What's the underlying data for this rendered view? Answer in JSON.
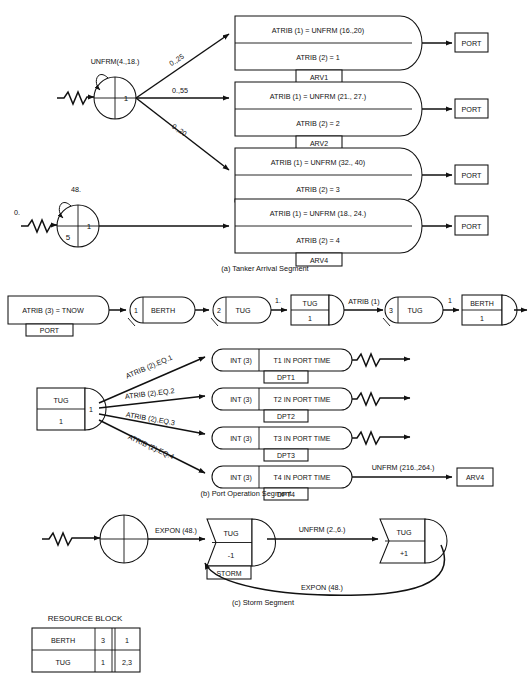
{
  "figure": {
    "captions": {
      "a": "(a)  Tanker Arrival Segment",
      "b": "(b) Port Operation Segment",
      "c": "(c)  Storm Segment"
    }
  },
  "segment_a": {
    "source1": {
      "self_loop_label": "UNFRM(4.,18.)",
      "quad_right": "1",
      "quad_lower_left": ""
    },
    "source2": {
      "self_loop_label": "48.",
      "start_label": "0.",
      "quad_right": "1",
      "quad_lower_left": "5"
    },
    "branch_probabilities": [
      "0.,25",
      "0.,55",
      "0.,20"
    ],
    "arrival_nodes": [
      {
        "line1": "ATRIB (1) = UNFRM (16.,20)",
        "line2": "ATRIB (2) = 1",
        "tag": "ARV1",
        "dest": "PORT"
      },
      {
        "line1": "ATRIB (1) = UNFRM (21., 27.)",
        "line2": "ATRIB (2) = 2",
        "tag": "ARV2",
        "dest": "PORT"
      },
      {
        "line1": "ATRIB (1) = UNFRM (32., 40)",
        "line2": "ATRIB (2) = 3",
        "tag": "ARV3",
        "dest": "PORT"
      },
      {
        "line1": "ATRIB (1) = UNFRM (18., 24.)",
        "line2": "ATRIB (2) = 4",
        "tag": "ARV4",
        "dest": "PORT"
      }
    ]
  },
  "segment_b_chain": {
    "assign_node": {
      "text": "ATRIB (3) = TNOW",
      "tag": "PORT"
    },
    "await1": {
      "num": "1",
      "label": "BERTH"
    },
    "await2": {
      "num": "2",
      "label": "TUG"
    },
    "link_label_1": "1.",
    "free1": {
      "label": "TUG",
      "value": "1"
    },
    "link_label_2": "ATRIB (1)",
    "await3": {
      "num": "3",
      "label": "TUG"
    },
    "link_label_3": "1",
    "free2": {
      "label": "BERTH",
      "value": "1"
    }
  },
  "segment_b": {
    "source_node": {
      "label": "TUG",
      "value": "1",
      "num": "1"
    },
    "branch_conditions": [
      "ATRIB (2).EQ.1",
      "ATRIB (2).EQ.2",
      "ATRIB (2).EQ.3",
      "ATRIB (2).EQ.4"
    ],
    "stat_nodes": [
      {
        "left": "INT (3)",
        "right": "T1  IN PORT TIME",
        "tag": "DPT1",
        "terminator": "sink"
      },
      {
        "left": "INT (3)",
        "right": "T2  IN PORT TIME",
        "tag": "DPT2",
        "terminator": "sink"
      },
      {
        "left": "INT (3)",
        "right": "T3  IN PORT TIME",
        "tag": "DPT3",
        "terminator": "sink"
      },
      {
        "left": "INT (3)",
        "right": "T4  IN PORT TIME",
        "tag": "DPT4",
        "terminator": "box",
        "out_label": "UNFRM (216.,264.)",
        "out_target": "ARV4"
      }
    ]
  },
  "segment_c": {
    "storm_node": {
      "label": "TUG",
      "value": "-1",
      "tag": "STORM"
    },
    "restore_node": {
      "label": "TUG",
      "value": "+1"
    },
    "edge_in": "EXPON (48.)",
    "edge_mid": "UNFRM (2.,6.)",
    "edge_return": "EXPON (48.)"
  },
  "resource_block": {
    "title": "RESOURCE BLOCK",
    "rows": [
      {
        "name": "BERTH",
        "capacity": "3",
        "queues": "1"
      },
      {
        "name": "TUG",
        "capacity": "1",
        "queues": "2,3"
      }
    ]
  }
}
